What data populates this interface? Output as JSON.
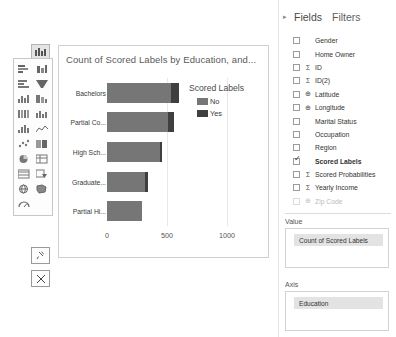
{
  "chart_data": {
    "type": "bar",
    "orientation": "horizontal",
    "stacked": true,
    "title": "Count of Scored Labels by Education, and...",
    "xlabel": "",
    "ylabel": "",
    "categories": [
      "Bachelors",
      "Partial Co...",
      "High Sch...",
      "Graduate...",
      "Partial Hi..."
    ],
    "series": [
      {
        "name": "No",
        "color": "#767676",
        "values": [
          530,
          510,
          440,
          320,
          290
        ]
      },
      {
        "name": "Yes",
        "color": "#3f3f3f",
        "values": [
          70,
          50,
          20,
          25,
          0
        ]
      }
    ],
    "totals": [
      600,
      560,
      460,
      345,
      290
    ],
    "xlim": [
      0,
      1100
    ],
    "xticks": [
      0,
      500,
      1000
    ],
    "xtick_labels": [
      "0",
      "500",
      "1000"
    ],
    "grid": true,
    "legend": {
      "title": "Scored Labels",
      "position": "right",
      "entries": [
        "No",
        "Yes"
      ]
    }
  },
  "viz_palette": {
    "selected_icon": "clustered-column-chart-icon",
    "icons": [
      "stacked-bar-chart-icon",
      "stacked-column-chart-icon",
      "clustered-bar-chart-icon",
      "funnel-chart-icon",
      "stacked-area-chart-icon",
      "waterfall-chart-icon",
      "ribbon-chart-icon",
      "line-and-column-chart-icon",
      "column-chart-icon",
      "line-chart-icon",
      "scatter-chart-icon",
      "matrix-icon",
      "pie-chart-icon",
      "table-icon",
      "card-icon",
      "slicer-icon",
      "map-icon",
      "filled-map-icon",
      "gauge-icon"
    ],
    "pin_label": "pin-icon",
    "close_label": "close-icon"
  },
  "right_pane": {
    "chevron": "▸",
    "tabs": [
      "Fields",
      "Filters"
    ],
    "active_tab": "Fields",
    "fields": [
      {
        "label": "Gender",
        "type": "",
        "checked": false,
        "bold": false
      },
      {
        "label": "Home Owner",
        "type": "",
        "checked": false,
        "bold": false
      },
      {
        "label": "ID",
        "type": "Σ",
        "checked": false,
        "bold": false
      },
      {
        "label": "ID(2)",
        "type": "Σ",
        "checked": false,
        "bold": false
      },
      {
        "label": "Latitude",
        "type": "⊕",
        "checked": false,
        "bold": false
      },
      {
        "label": "Longitude",
        "type": "⊕",
        "checked": false,
        "bold": false
      },
      {
        "label": "Marital Status",
        "type": "",
        "checked": false,
        "bold": false
      },
      {
        "label": "Occupation",
        "type": "",
        "checked": false,
        "bold": false
      },
      {
        "label": "Region",
        "type": "",
        "checked": false,
        "bold": false
      },
      {
        "label": "Scored Labels",
        "type": "",
        "checked": true,
        "bold": true
      },
      {
        "label": "Scored Probabilities",
        "type": "Σ",
        "checked": false,
        "bold": false
      },
      {
        "label": "Yearly Income",
        "type": "Σ",
        "checked": false,
        "bold": false
      },
      {
        "label": "Zip Code",
        "type": "⊕",
        "checked": false,
        "bold": false
      }
    ],
    "wells": [
      {
        "label": "Value",
        "chip": "Count of Scored Labels"
      },
      {
        "label": "Axis",
        "chip": "Education"
      }
    ]
  },
  "colors": {
    "series_no": "#767676",
    "series_yes": "#3f3f3f",
    "grid": "#e8e8e8",
    "chip_bg": "#e3e3e3"
  }
}
